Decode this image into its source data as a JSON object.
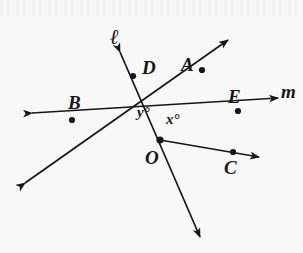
{
  "figure": {
    "background_color": "#f8f8f7",
    "ink_color": "#16161a",
    "vertex": {
      "name": "O",
      "label": "O",
      "x": 160,
      "y": 140
    },
    "point_labels": [
      {
        "id": "A",
        "label": "A",
        "dot_x": 202,
        "dot_y": 70,
        "label_x": 181,
        "label_y": 55
      },
      {
        "id": "B",
        "label": "B",
        "dot_x": 72,
        "dot_y": 120,
        "label_x": 68,
        "label_y": 93
      },
      {
        "id": "C",
        "label": "C",
        "dot_x": 233,
        "dot_y": 152,
        "label_x": 224,
        "label_y": 158
      },
      {
        "id": "D",
        "label": "D",
        "dot_x": 133,
        "dot_y": 76,
        "label_x": 142,
        "label_y": 58
      },
      {
        "id": "E",
        "label": "E",
        "dot_x": 238,
        "dot_y": 111,
        "label_x": 228,
        "label_y": 87
      }
    ],
    "line_labels": [
      {
        "id": "ell",
        "label": "ℓ",
        "x": 110,
        "y": 26
      },
      {
        "id": "m",
        "label": "m",
        "x": 281,
        "y": 82
      }
    ],
    "angle_labels": [
      {
        "id": "y",
        "variable": "y",
        "unit": "°",
        "text": "y°",
        "x": 137,
        "y": 105
      },
      {
        "id": "x",
        "variable": "x",
        "unit": "°",
        "text": "x°",
        "x": 166,
        "y": 112
      }
    ],
    "segments": [
      {
        "id": "line-ell",
        "name": "line-ell",
        "x1": 120,
        "y1": 52,
        "x2": 200,
        "y2": 237,
        "arrow_start": true,
        "arrow_end": true
      },
      {
        "id": "line-m",
        "name": "line-m",
        "x1": 32,
        "y1": 113,
        "x2": 278,
        "y2": 98,
        "arrow_start": true,
        "arrow_end": true
      },
      {
        "id": "line-b-diag",
        "name": "line-b-to-a",
        "x1": 25,
        "y1": 183,
        "x2": 228,
        "y2": 40,
        "arrow_start": true,
        "arrow_end": true
      },
      {
        "id": "ray-c",
        "name": "ray-o-to-c",
        "x1": 160,
        "y1": 140,
        "x2": 259,
        "y2": 157,
        "arrow_start": false,
        "arrow_end": true
      }
    ]
  }
}
